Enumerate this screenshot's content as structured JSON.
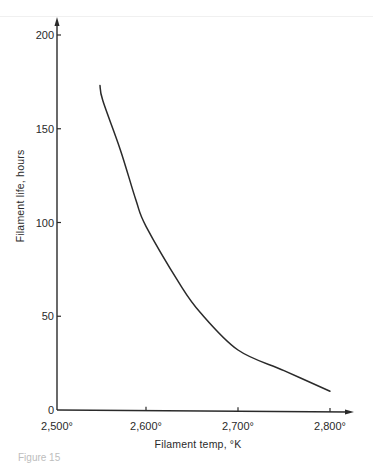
{
  "chart_data": {
    "type": "line",
    "title": "",
    "xlabel": "Filament temp, °K",
    "ylabel": "Filament life, hours",
    "xlim": [
      2500,
      2820
    ],
    "ylim": [
      0,
      205
    ],
    "x_ticks": [
      2500,
      2600,
      2700,
      2800
    ],
    "x_tick_labels": [
      "2,500°",
      "2,600°",
      "2,700°",
      "2,800°"
    ],
    "y_ticks": [
      0,
      50,
      100,
      150,
      200
    ],
    "y_tick_labels": [
      "0",
      "50",
      "100",
      "150",
      "200"
    ],
    "grid": false,
    "legend": null,
    "series": [
      {
        "name": "Filament life vs temperature",
        "x": [
          2550,
          2553,
          2572,
          2589,
          2600,
          2637,
          2659,
          2700,
          2750,
          2800
        ],
        "y": [
          173,
          165,
          139,
          112,
          98,
          67,
          52,
          32,
          21,
          10
        ]
      }
    ]
  },
  "caption": "Figure 15"
}
